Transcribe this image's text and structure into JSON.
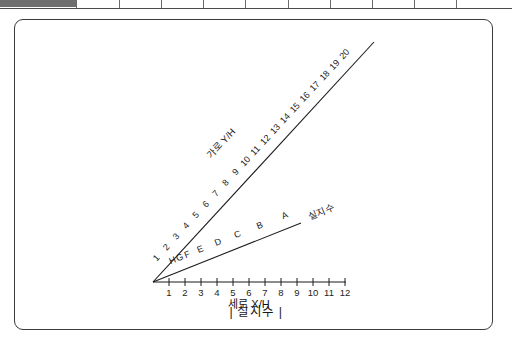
{
  "top_strip": {
    "name": "ruler-strip",
    "segment_count": 9
  },
  "figure": {
    "caption": "| 실지수 |",
    "x_axis": {
      "title": "세로 X/H",
      "ticks": [
        "1",
        "2",
        "3",
        "4",
        "5",
        "6",
        "7",
        "8",
        "9",
        "10",
        "11",
        "12"
      ]
    },
    "upper_line": {
      "title": "가로 Y/H",
      "labels": [
        "1",
        "2",
        "3",
        "4",
        "5",
        "6",
        "7",
        "8",
        "9",
        "10",
        "11",
        "12",
        "13",
        "14",
        "15",
        "16",
        "17",
        "18",
        "19",
        "20"
      ]
    },
    "lower_line": {
      "title": "실지수",
      "labels": [
        "H",
        "G",
        "F",
        "E",
        "D",
        "C",
        "B",
        "A"
      ]
    },
    "colors": {
      "ink": "#1d1d1d",
      "frame": "#3b3b3b",
      "strip_fill": "#6f6f6f"
    }
  }
}
